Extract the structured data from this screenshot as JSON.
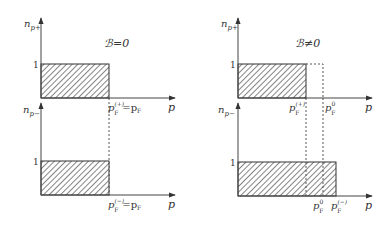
{
  "panels": [
    {
      "id": "left",
      "title": "ℬ=0",
      "top_axis": {
        "ylabel_main": "n",
        "ylabel_sub": "p+",
        "xlabel": "p",
        "tick_one": "1",
        "fermi_label_main": "p",
        "fermi_label_sup": "(+)",
        "fermi_label_sub": "F",
        "fermi_label_rhs": "=p",
        "fermi_label_rhs_sub": "F"
      },
      "bottom_axis": {
        "ylabel_main": "n",
        "ylabel_sub": "p−",
        "xlabel": "p",
        "tick_one": "1",
        "fermi_label_main": "p",
        "fermi_label_sup": "(−)",
        "fermi_label_sub": "F",
        "fermi_label_rhs": "=p",
        "fermi_label_rhs_sub": "F"
      }
    },
    {
      "id": "right",
      "title": "ℬ≠0",
      "top_axis": {
        "ylabel_main": "n",
        "ylabel_sub": "p+",
        "xlabel": "p",
        "tick_one": "1",
        "fermi_plus_main": "p",
        "fermi_plus_sup": "(+)",
        "fermi_plus_sub": "F",
        "fermi_zero_main": "p",
        "fermi_zero_sup": "0",
        "fermi_zero_sub": "F"
      },
      "bottom_axis": {
        "ylabel_main": "n",
        "ylabel_sub": "p−",
        "xlabel": "p",
        "tick_one": "1",
        "fermi_zero_main": "p",
        "fermi_zero_sup": "0",
        "fermi_zero_sub": "F",
        "fermi_minus_main": "p",
        "fermi_minus_sup": "(−)",
        "fermi_minus_sub": "F"
      }
    }
  ]
}
